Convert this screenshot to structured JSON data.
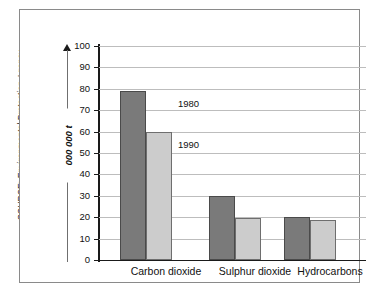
{
  "source_credit": "SOURCE: Environmental Protection Agency",
  "chart_data": {
    "type": "bar",
    "title": "",
    "subtitle": "",
    "xlabel": "",
    "ylabel": "000 000 t",
    "ylim": [
      0,
      100
    ],
    "ytick_labels": [
      "100",
      "90",
      "80",
      "70",
      "60",
      "50",
      "40",
      "30",
      "20",
      "10",
      "0"
    ],
    "ytick_values": [
      100,
      90,
      80,
      70,
      60,
      50,
      40,
      30,
      20,
      10,
      0
    ],
    "grid": true,
    "legend_position": "inline-annotation",
    "categories": [
      "Carbon dioxide",
      "Sulphur dioxide",
      "Hydrocarbons"
    ],
    "series": [
      {
        "name": "1980",
        "color": "#7a7a7a",
        "values": [
          79,
          30,
          20
        ]
      },
      {
        "name": "1990",
        "color": "#cccccc",
        "values": [
          60,
          19.5,
          18.5
        ]
      }
    ],
    "annotations": [
      {
        "text": "1980",
        "series": "1980"
      },
      {
        "text": "1990",
        "series": "1990"
      }
    ]
  }
}
